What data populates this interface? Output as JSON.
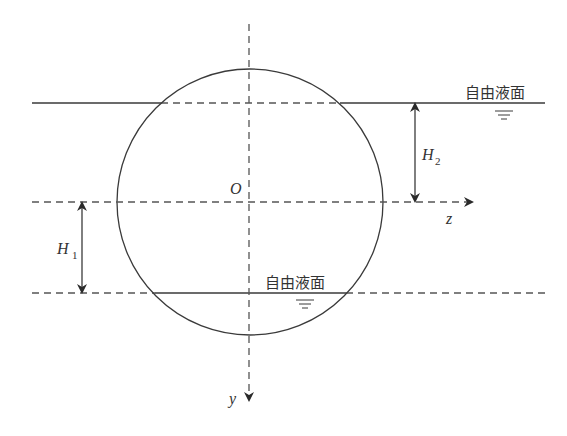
{
  "diagram": {
    "title": "",
    "colors": {
      "line": "#3a3a3a",
      "dashed": "#555555",
      "text": "#333333",
      "background": "#ffffff"
    },
    "axes": {
      "origin_label": "O",
      "horizontal_axis_label": "z",
      "vertical_axis_label": "y"
    },
    "surfaces": {
      "top_label": "自由液面",
      "bottom_label": "自由液面"
    },
    "dimensions": {
      "h2_label": "H",
      "h2_subscript": "2",
      "h1_label": "H",
      "h1_subscript": "1"
    },
    "geometry": {
      "circle": {
        "cx": 250,
        "cy": 202,
        "r": 133
      },
      "top_surface_y": 103,
      "bottom_surface_y": 293,
      "axis_z_y": 202,
      "axis_y_x": 249
    }
  }
}
